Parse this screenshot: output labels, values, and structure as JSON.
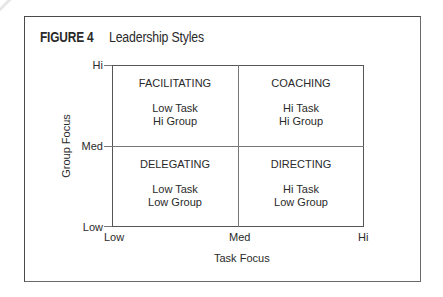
{
  "figure": {
    "label": "FIGURE 4",
    "title": "Leadership Styles"
  },
  "axes": {
    "y_title": "Group Focus",
    "x_title": "Task Focus",
    "y_ticks": [
      "Hi",
      "Med",
      "Low"
    ],
    "x_ticks": [
      "Low",
      "Med",
      "Hi"
    ]
  },
  "quadrants": {
    "top_left": {
      "name": "FACILITATING",
      "line1": "Low Task",
      "line2": "Hi Group"
    },
    "top_right": {
      "name": "COACHING",
      "line1": "Hi Task",
      "line2": "Hi Group"
    },
    "bottom_left": {
      "name": "DELEGATING",
      "line1": "Low Task",
      "line2": "Low Group"
    },
    "bottom_right": {
      "name": "DIRECTING",
      "line1": "Hi Task",
      "line2": "Low Group"
    }
  },
  "colors": {
    "line": "#555555",
    "text": "#2a2a2a",
    "background": "#ffffff"
  }
}
